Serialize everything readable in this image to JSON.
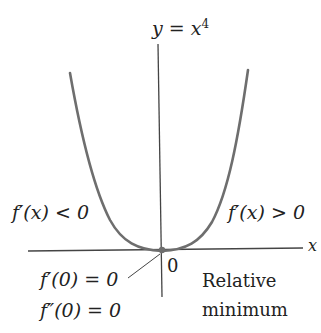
{
  "diagram": {
    "title_parts": {
      "lhs": "y",
      "eq": " = ",
      "base": "x",
      "exp": "4"
    },
    "x_axis_label": "x",
    "origin_label": "0",
    "left_label": "f′(x) < 0",
    "right_label": "f′(x) > 0",
    "first_derivative_at_zero": "f′(0) = 0",
    "second_derivative_at_zero": "f″(0) = 0",
    "extremum_label_line1": "Relative",
    "extremum_label_line2": "minimum",
    "colors": {
      "curve": "#6e6e6e",
      "axis": "#444444",
      "text": "#222222",
      "background": "#ffffff"
    }
  }
}
